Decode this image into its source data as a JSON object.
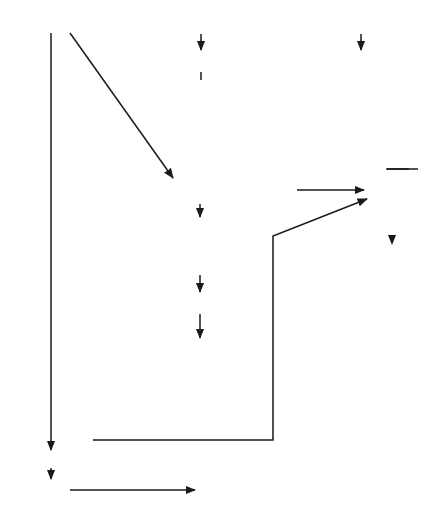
{
  "diagram": {
    "type": "clinical-flowchart",
    "entry_nodes": {
      "clinical_manifestations": "Clinical manifestations",
      "clinical_manifestations_lines": [
        "Clinical",
        "manifestations"
      ],
      "or_1": "or",
      "history": "History of sexual contact with infected individual",
      "history_lines": [
        "History of sexual contact",
        "with infected individual"
      ],
      "or_2": "or",
      "screening": "Positive screening culture",
      "screening_lines": [
        "Positive screening",
        "culture"
      ]
    },
    "management_label": "Proceed to management",
    "branch_labels": {
      "female": "Female",
      "male_or_newborn_lines": [
        "Male or",
        "newborn"
      ],
      "yes": "Yes",
      "no": "No"
    },
    "nodes": {
      "proceed_1": "Proceed to management",
      "proceed_2": "Proceed to management",
      "confirm_culture_1_lines": [
        "Diagnosis",
        "may be",
        "confirmed",
        "by culture"
      ],
      "microscopic_lines": [
        "Microscopic examination",
        "of smear positive"
      ],
      "probable_lines": [
        "Diagnosis",
        "probable"
      ],
      "proceed_3": "Proceed to management",
      "confirm_culture_2_lines": [
        "Diagnosis",
        "may be",
        "confirmed",
        "by culture"
      ],
      "less_likely_lines": [
        "Diagnosis",
        "less likely"
      ],
      "culture_positive_lines": [
        "Culture",
        "positive"
      ],
      "confirmed_lines": [
        "Diagnosis",
        "confirmed"
      ],
      "proceed_4": "Proceed to management"
    },
    "differential": {
      "title": "Differential diagnosis",
      "groups": [
        {
          "label": "Male",
          "items": [
            [
              "Nonspecific",
              "urethritis"
            ],
            [
              "Chlamydia"
            ],
            [
              "Reiter’s syndrome"
            ],
            [
              "Herpes"
            ]
          ]
        },
        {
          "label": "Female",
          "items": [
            [
              "Cervicitis and",
              "pelvic inflam-",
              "matory disease",
              "(PID) of any",
              "etiology"
            ],
            [
              "Foreign body"
            ]
          ]
        }
      ],
      "fill_color": "#b3b3b3"
    }
  }
}
